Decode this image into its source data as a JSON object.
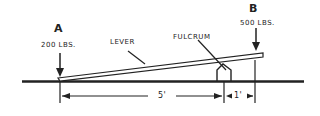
{
  "diagram": {
    "point_a": {
      "label": "A",
      "load": "200 LBS."
    },
    "point_b": {
      "label": "B",
      "load": "500 LBS."
    },
    "lever_label": "LEVER",
    "fulcrum_label": "FULCRUM",
    "dimension_long": "5'",
    "dimension_short": "1'",
    "line_color": "#222222"
  }
}
